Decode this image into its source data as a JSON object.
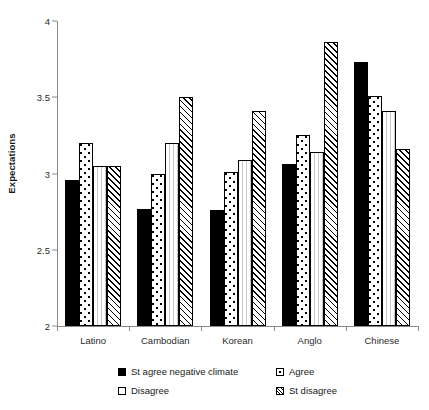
{
  "chart_data": {
    "type": "bar",
    "title": "",
    "xlabel": "",
    "ylabel": "Expectations",
    "ylim": [
      2,
      4
    ],
    "yticks": [
      "2",
      "2.5",
      "3",
      "3.5",
      "4"
    ],
    "grid": false,
    "legend_position": "bottom",
    "categories": [
      "Latino",
      "Cambodian",
      "Korean",
      "Anglo",
      "Chinese"
    ],
    "series": [
      {
        "name": "St agree negative climate",
        "pattern": "solid-black",
        "values": [
          2.96,
          2.77,
          2.76,
          3.06,
          3.73
        ]
      },
      {
        "name": "Agree",
        "pattern": "dots",
        "values": [
          3.2,
          3.0,
          3.01,
          3.25,
          3.51
        ]
      },
      {
        "name": "Disagree",
        "pattern": "vlines",
        "values": [
          3.05,
          3.2,
          3.09,
          3.14,
          3.41
        ]
      },
      {
        "name": "St disagree",
        "pattern": "hatch",
        "values": [
          3.05,
          3.5,
          3.41,
          3.86,
          3.16
        ]
      }
    ]
  },
  "axis": {
    "y_title": "Expectations"
  },
  "legend": {
    "items": [
      {
        "label": "St agree negative climate",
        "swatch": "solid-black-square-icon"
      },
      {
        "label": "Agree",
        "swatch": "dotted-square-icon"
      },
      {
        "label": "Disagree",
        "swatch": "white-square-icon"
      },
      {
        "label": "St disagree",
        "swatch": "hatched-square-icon"
      }
    ]
  }
}
